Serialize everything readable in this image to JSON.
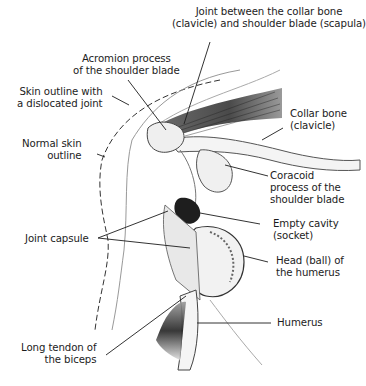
{
  "diagram": {
    "labels": {
      "ac_joint": "Joint between the collar bone\n(clavicle) and shoulder blade (scapula)",
      "acromion": "Acromion process\nof the shoulder blade",
      "skin_dislocated": "Skin outline with\na dislocated joint",
      "normal_skin": "Normal skin\noutline",
      "collar_bone": "Collar bone\n(clavicle)",
      "coracoid": "Coracoid\nprocess of the\nshoulder blade",
      "empty_cavity": "Empty cavity\n(socket)",
      "joint_capsule": "Joint capsule",
      "humeral_head": "Head (ball) of\nthe humerus",
      "humerus": "Humerus",
      "biceps_tendon": "Long tendon of\nthe biceps"
    },
    "colors": {
      "ink": "#1c1c1c",
      "shade_dark": "#2a2a2a",
      "shade_mid": "#8a8a8a",
      "shade_light": "#d6d6d6",
      "background": "#ffffff"
    }
  }
}
